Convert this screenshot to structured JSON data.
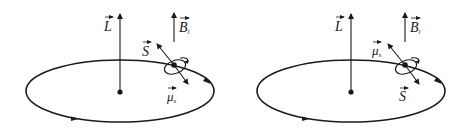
{
  "figure": {
    "colors": {
      "stroke": "#1a1a1a",
      "background": "#ffffff"
    },
    "panels": [
      {
        "id": "left",
        "labels": {
          "L": "L",
          "B": "B",
          "B_sub": "l",
          "upper_vector": "S",
          "lower_vector": "μ",
          "lower_vector_sub": "s"
        },
        "upper_vector_meaning": "spin S (pointing up-left)",
        "lower_vector_meaning": "magnetic moment μs (pointing down-right)"
      },
      {
        "id": "right",
        "labels": {
          "L": "L",
          "B": "B",
          "B_sub": "l",
          "upper_vector": "μ",
          "upper_vector_sub": "s",
          "lower_vector": "S"
        },
        "upper_vector_meaning": "magnetic moment μs (pointing up-left)",
        "lower_vector_meaning": "spin S (pointing down-right)"
      }
    ]
  }
}
